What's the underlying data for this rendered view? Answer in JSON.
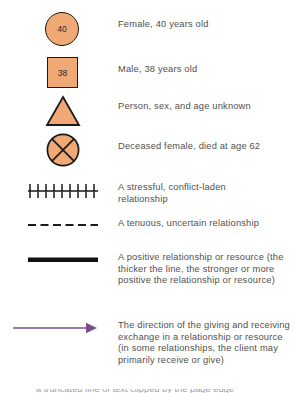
{
  "legend": {
    "title": "Genogram and Eco-Map Symbol Key",
    "colors": {
      "symbol_fill": "#F0A875",
      "symbol_stroke": "#1a1a1a",
      "text": "#4f4f4f",
      "arrow": "#7B4F8E",
      "positive_line": "#111111"
    },
    "rows": [
      {
        "symbol": "circle-with-age",
        "age": "40",
        "description": "Female, 40 years old"
      },
      {
        "symbol": "square-with-age",
        "age": "38",
        "description": "Male, 38 years old"
      },
      {
        "symbol": "triangle",
        "age": "",
        "description": "Person, sex, and age unknown"
      },
      {
        "symbol": "circle-with-x",
        "age": "",
        "description": "Deceased female, died at age 62"
      },
      {
        "symbol": "hatched-line",
        "age": "",
        "description": "A stressful, conflict-laden relationship"
      },
      {
        "symbol": "dashed-line",
        "age": "",
        "description": "A tenuous, uncertain relationship"
      },
      {
        "symbol": "thick-line",
        "age": "",
        "description": "A positive relationship or resource (the thicker the line, the stronger or more positive the relationship or resource)"
      },
      {
        "symbol": "arrow-line",
        "age": "",
        "description": "The direction of the giving and receiving exchange in a relationship or resource (in some relationships, the client may primarily receive or give)"
      }
    ],
    "clipped_bottom_text": "a truncated line of text clipped by the page edge"
  }
}
